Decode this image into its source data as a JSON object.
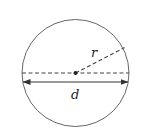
{
  "diagram": {
    "labels": {
      "radius": "r",
      "diameter": "d"
    },
    "colors": {
      "stroke": "#555555",
      "label": "#222222",
      "background": "#ffffff"
    },
    "geometry": {
      "center": [
        75.5,
        73
      ],
      "radius": 53.5,
      "radius_end": [
        125,
        47
      ],
      "diameter_dashed_y": 73,
      "diameter_arrow_y": 82
    }
  }
}
